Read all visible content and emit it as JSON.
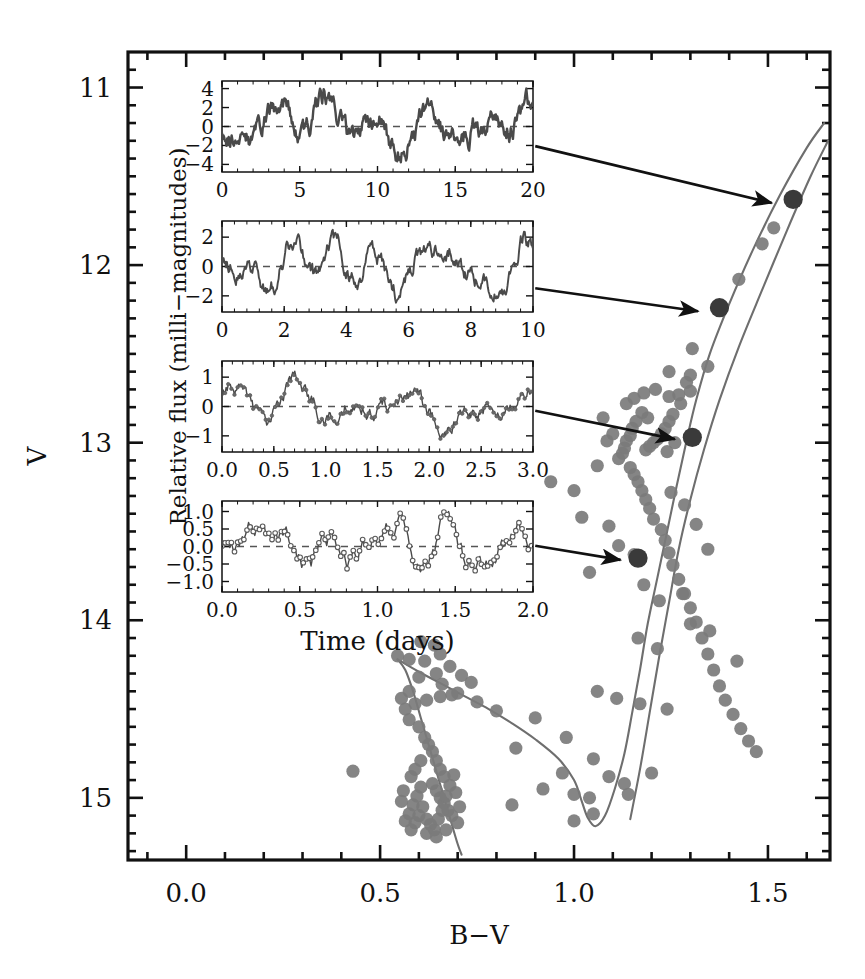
{
  "figure": {
    "type": "scatter-with-insets",
    "background": "#ffffff",
    "ink": "#111111",
    "point_color": "#7b7b7b",
    "highlight_color": "#3a3a3a",
    "isochrone_color": "#6e6e6e"
  },
  "main_axes": {
    "xlabel": "B−V",
    "ylabel": "V",
    "xlim": [
      -0.15,
      1.66
    ],
    "ylim_inverted": [
      15.35,
      10.8
    ],
    "xticks_major": [
      0.0,
      0.5,
      1.0,
      1.5
    ],
    "xtick_labels": [
      "0.0",
      "0.5",
      "1.0",
      "1.5"
    ],
    "xtick_minor_step": 0.1,
    "yticks_major": [
      11,
      12,
      13,
      14,
      15
    ],
    "ytick_labels": [
      "11",
      "12",
      "13",
      "14",
      "15"
    ],
    "ytick_minor_step": 0.1,
    "grid": false,
    "frame": true
  },
  "chart_data": {
    "type": "scatter",
    "title": "",
    "xlabel": "B−V",
    "ylabel": "V",
    "xlim": [
      -0.15,
      1.66
    ],
    "ylim": [
      15.35,
      10.8
    ],
    "ylim_note": "magnitude axis inverted (brighter at top)",
    "grid": false,
    "legend": null,
    "series": [
      {
        "name": "cluster members",
        "marker": "filled circle",
        "color": "#7b7b7b",
        "points": [
          [
            1.565,
            11.63
          ],
          [
            1.515,
            11.79
          ],
          [
            1.485,
            11.88
          ],
          [
            1.425,
            12.08
          ],
          [
            1.375,
            12.24
          ],
          [
            1.305,
            12.47
          ],
          [
            1.245,
            12.6
          ],
          [
            1.345,
            12.57
          ],
          [
            1.3,
            12.71
          ],
          [
            1.275,
            12.78
          ],
          [
            1.255,
            12.84
          ],
          [
            1.245,
            12.88
          ],
          [
            1.235,
            12.92
          ],
          [
            1.225,
            12.95
          ],
          [
            1.215,
            12.98
          ],
          [
            1.205,
            13.0
          ],
          [
            1.195,
            13.02
          ],
          [
            1.185,
            13.04
          ],
          [
            1.24,
            13.05
          ],
          [
            1.26,
            13.0
          ],
          [
            1.19,
            12.86
          ],
          [
            1.175,
            12.83
          ],
          [
            1.16,
            12.88
          ],
          [
            1.15,
            12.92
          ],
          [
            1.145,
            12.96
          ],
          [
            1.135,
            12.99
          ],
          [
            1.13,
            13.03
          ],
          [
            1.125,
            13.06
          ],
          [
            1.115,
            13.09
          ],
          [
            1.1,
            12.95
          ],
          [
            1.085,
            12.99
          ],
          [
            1.075,
            12.86
          ],
          [
            1.135,
            12.78
          ],
          [
            1.155,
            12.75
          ],
          [
            1.18,
            12.72
          ],
          [
            1.21,
            12.7
          ],
          [
            1.245,
            12.74
          ],
          [
            1.27,
            12.73
          ],
          [
            1.29,
            12.66
          ],
          [
            1.3,
            12.62
          ],
          [
            1.145,
            13.14
          ],
          [
            1.155,
            13.18
          ],
          [
            1.165,
            13.22
          ],
          [
            1.175,
            13.27
          ],
          [
            1.185,
            13.32
          ],
          [
            1.195,
            13.37
          ],
          [
            1.205,
            13.43
          ],
          [
            1.225,
            13.49
          ],
          [
            1.235,
            13.55
          ],
          [
            1.245,
            13.62
          ],
          [
            1.255,
            13.69
          ],
          [
            1.27,
            13.77
          ],
          [
            1.285,
            13.85
          ],
          [
            1.3,
            13.93
          ],
          [
            1.315,
            14.01
          ],
          [
            1.33,
            14.1
          ],
          [
            1.345,
            14.19
          ],
          [
            1.36,
            14.28
          ],
          [
            1.375,
            14.37
          ],
          [
            1.39,
            14.45
          ],
          [
            1.41,
            14.53
          ],
          [
            1.43,
            14.61
          ],
          [
            1.45,
            14.68
          ],
          [
            1.47,
            14.74
          ],
          [
            1.25,
            13.28
          ],
          [
            1.285,
            13.35
          ],
          [
            1.315,
            13.46
          ],
          [
            1.345,
            13.6
          ],
          [
            1.06,
            13.13
          ],
          [
            1.0,
            13.27
          ],
          [
            0.94,
            13.22
          ],
          [
            1.02,
            13.42
          ],
          [
            1.09,
            13.47
          ],
          [
            1.115,
            13.58
          ],
          [
            1.155,
            13.63
          ],
          [
            1.04,
            13.73
          ],
          [
            1.18,
            13.8
          ],
          [
            1.22,
            13.89
          ],
          [
            1.28,
            13.85
          ],
          [
            1.3,
            14.02
          ],
          [
            1.35,
            14.06
          ],
          [
            1.42,
            14.23
          ],
          [
            1.165,
            14.1
          ],
          [
            1.215,
            14.16
          ],
          [
            1.06,
            14.4
          ],
          [
            1.11,
            14.44
          ],
          [
            1.17,
            14.47
          ],
          [
            1.24,
            14.5
          ],
          [
            0.98,
            14.66
          ],
          [
            1.05,
            14.78
          ],
          [
            1.09,
            14.88
          ],
          [
            1.13,
            14.92
          ],
          [
            1.0,
            14.98
          ],
          [
            1.04,
            15.0
          ],
          [
            0.85,
            14.72
          ],
          [
            0.9,
            14.55
          ],
          [
            0.8,
            14.51
          ],
          [
            0.75,
            14.46
          ],
          [
            0.7,
            14.41
          ],
          [
            0.66,
            14.36
          ],
          [
            0.645,
            14.3
          ],
          [
            0.68,
            14.26
          ],
          [
            0.71,
            14.31
          ],
          [
            0.735,
            14.35
          ],
          [
            0.615,
            14.23
          ],
          [
            0.575,
            14.22
          ],
          [
            0.545,
            14.2
          ],
          [
            0.605,
            14.12
          ],
          [
            0.64,
            14.14
          ],
          [
            0.655,
            14.19
          ],
          [
            0.6,
            14.32
          ],
          [
            0.575,
            14.4
          ],
          [
            0.555,
            14.44
          ],
          [
            0.565,
            14.5
          ],
          [
            0.59,
            14.47
          ],
          [
            0.62,
            14.45
          ],
          [
            0.655,
            14.43
          ],
          [
            0.685,
            14.42
          ],
          [
            0.575,
            14.56
          ],
          [
            0.6,
            14.6
          ],
          [
            0.615,
            14.66
          ],
          [
            0.625,
            14.7
          ],
          [
            0.635,
            14.74
          ],
          [
            0.645,
            14.79
          ],
          [
            0.655,
            14.84
          ],
          [
            0.665,
            14.88
          ],
          [
            0.605,
            14.79
          ],
          [
            0.59,
            14.84
          ],
          [
            0.58,
            14.88
          ],
          [
            0.635,
            14.92
          ],
          [
            0.645,
            14.96
          ],
          [
            0.655,
            15.0
          ],
          [
            0.665,
            15.03
          ],
          [
            0.675,
            15.07
          ],
          [
            0.685,
            15.1
          ],
          [
            0.605,
            14.94
          ],
          [
            0.595,
            14.99
          ],
          [
            0.585,
            15.04
          ],
          [
            0.575,
            15.09
          ],
          [
            0.62,
            15.12
          ],
          [
            0.63,
            15.15
          ],
          [
            0.64,
            15.18
          ],
          [
            0.65,
            15.12
          ],
          [
            0.66,
            15.07
          ],
          [
            0.67,
            14.99
          ],
          [
            0.68,
            14.93
          ],
          [
            0.69,
            14.87
          ],
          [
            0.695,
            14.97
          ],
          [
            0.61,
            15.05
          ],
          [
            0.6,
            15.1
          ],
          [
            0.59,
            15.14
          ],
          [
            0.62,
            15.2
          ],
          [
            0.645,
            15.22
          ],
          [
            0.67,
            15.18
          ],
          [
            0.7,
            15.14
          ],
          [
            0.705,
            15.05
          ],
          [
            0.56,
            14.96
          ],
          [
            0.555,
            15.02
          ],
          [
            0.565,
            15.13
          ],
          [
            0.58,
            15.18
          ],
          [
            0.43,
            14.85
          ],
          [
            0.84,
            15.04
          ],
          [
            0.92,
            14.95
          ],
          [
            0.97,
            14.86
          ],
          [
            1.0,
            15.13
          ],
          [
            1.05,
            15.09
          ],
          [
            1.14,
            14.98
          ],
          [
            1.2,
            14.86
          ]
        ]
      },
      {
        "name": "highlighted targets (with light curves)",
        "marker": "large filled circle",
        "color": "#3a3a3a",
        "points": [
          [
            1.565,
            11.63
          ],
          [
            1.375,
            12.24
          ],
          [
            1.305,
            12.97
          ],
          [
            1.165,
            13.65
          ]
        ]
      }
    ],
    "isochrones": [
      {
        "name": "isochrone-left",
        "color": "#6e6e6e",
        "path": [
          [
            0.545,
            14.22
          ],
          [
            0.565,
            14.28
          ],
          [
            0.585,
            14.4
          ],
          [
            0.605,
            14.55
          ],
          [
            0.625,
            14.7
          ],
          [
            0.645,
            14.85
          ],
          [
            0.665,
            15.0
          ],
          [
            0.685,
            15.15
          ],
          [
            0.7,
            15.26
          ],
          [
            0.71,
            15.32
          ]
        ]
      },
      {
        "name": "isochrone-turnoff-to-giant",
        "color": "#6e6e6e",
        "path": [
          [
            0.545,
            14.22
          ],
          [
            0.6,
            14.29
          ],
          [
            0.66,
            14.36
          ],
          [
            0.72,
            14.43
          ],
          [
            0.78,
            14.5
          ],
          [
            0.84,
            14.58
          ],
          [
            0.9,
            14.67
          ],
          [
            0.96,
            14.78
          ],
          [
            1.0,
            14.9
          ],
          [
            1.02,
            15.02
          ],
          [
            1.035,
            15.11
          ],
          [
            1.055,
            15.16
          ],
          [
            1.08,
            15.1
          ],
          [
            1.105,
            14.95
          ],
          [
            1.13,
            14.75
          ],
          [
            1.15,
            14.52
          ],
          [
            1.17,
            14.28
          ],
          [
            1.19,
            14.02
          ],
          [
            1.215,
            13.76
          ],
          [
            1.24,
            13.5
          ],
          [
            1.265,
            13.24
          ],
          [
            1.29,
            12.99
          ],
          [
            1.315,
            12.76
          ],
          [
            1.35,
            12.5
          ],
          [
            1.4,
            12.22
          ],
          [
            1.46,
            11.92
          ],
          [
            1.53,
            11.61
          ],
          [
            1.6,
            11.34
          ],
          [
            1.645,
            11.2
          ]
        ]
      },
      {
        "name": "isochrone-giant-branch-right",
        "color": "#6e6e6e",
        "path": [
          [
            1.145,
            15.12
          ],
          [
            1.17,
            14.84
          ],
          [
            1.195,
            14.52
          ],
          [
            1.22,
            14.2
          ],
          [
            1.245,
            13.9
          ],
          [
            1.27,
            13.6
          ],
          [
            1.3,
            13.32
          ],
          [
            1.335,
            13.04
          ],
          [
            1.375,
            12.76
          ],
          [
            1.425,
            12.46
          ],
          [
            1.485,
            12.14
          ],
          [
            1.55,
            11.8
          ],
          [
            1.61,
            11.5
          ],
          [
            1.655,
            11.3
          ]
        ]
      }
    ],
    "annotations": [
      {
        "name": "arrow-1",
        "from": [
          0.9,
          11.33
        ],
        "to": [
          1.51,
          11.65
        ]
      },
      {
        "name": "arrow-2",
        "from": [
          0.9,
          12.13
        ],
        "to": [
          1.32,
          12.26
        ]
      },
      {
        "name": "arrow-3",
        "from": [
          0.9,
          12.82
        ],
        "to": [
          1.26,
          12.98
        ]
      },
      {
        "name": "arrow-4",
        "from": [
          0.9,
          13.58
        ],
        "to": [
          1.12,
          13.66
        ]
      }
    ]
  },
  "insets": {
    "shared_xlabel": "Time (days)",
    "shared_ylabel": "Relative flux (milli−magnitudes)",
    "panels": [
      {
        "name": "light-curve-panel-1",
        "xlim": [
          0,
          20
        ],
        "xticks": [
          0,
          5,
          10,
          15,
          20
        ],
        "xtick_labels": [
          "0",
          "5",
          "10",
          "15",
          "20"
        ],
        "ylim": [
          -4.8,
          4.8
        ],
        "yticks": [
          -4,
          -2,
          0,
          2,
          4
        ],
        "ytick_labels": [
          "−4",
          "−2",
          "0",
          "2",
          "4"
        ],
        "zero_line": 0,
        "amplitude_mmag": 4,
        "marker": "dense line",
        "seed": 11,
        "npoints": 420,
        "roughness": 0.55,
        "scale": 1.85
      },
      {
        "name": "light-curve-panel-2",
        "xlim": [
          0,
          10
        ],
        "xticks": [
          0,
          2,
          4,
          6,
          8,
          10
        ],
        "xtick_labels": [
          "0",
          "2",
          "4",
          "6",
          "8",
          "10"
        ],
        "ylim": [
          -3.1,
          3.1
        ],
        "yticks": [
          -2,
          0,
          2
        ],
        "ytick_labels": [
          "−2",
          "0",
          "2"
        ],
        "zero_line": 0,
        "amplitude_mmag": 2.5,
        "marker": "dense line",
        "seed": 29,
        "npoints": 380,
        "roughness": 0.5,
        "scale": 1.25
      },
      {
        "name": "light-curve-panel-3",
        "xlim": [
          0,
          3
        ],
        "xticks": [
          0,
          0.5,
          1.0,
          1.5,
          2.0,
          2.5,
          3.0
        ],
        "xtick_labels": [
          "0.0",
          "0.5",
          "1.0",
          "1.5",
          "2.0",
          "2.5",
          "3.0"
        ],
        "ylim": [
          -1.55,
          1.55
        ],
        "yticks": [
          -1,
          0,
          1
        ],
        "ytick_labels": [
          "−1",
          "0",
          "1"
        ],
        "zero_line": 0,
        "amplitude_mmag": 1.2,
        "marker": "points + line",
        "seed": 47,
        "npoints": 300,
        "roughness": 0.45,
        "scale": 0.62
      },
      {
        "name": "light-curve-panel-4",
        "xlim": [
          0,
          2
        ],
        "xticks": [
          0,
          0.5,
          1.0,
          1.5,
          2.0
        ],
        "xtick_labels": [
          "0.0",
          "0.5",
          "1.0",
          "1.5",
          "2.0"
        ],
        "ylim": [
          -1.3,
          1.3
        ],
        "yticks": [
          -1.0,
          -0.5,
          0.0,
          0.5,
          1.0
        ],
        "ytick_labels": [
          "−1.0",
          "−0.5",
          "0.0",
          "0.5",
          "1.0"
        ],
        "zero_line": 0,
        "amplitude_mmag": 1.0,
        "marker": "open circles + line",
        "seed": 73,
        "npoints": 200,
        "roughness": 0.62,
        "scale": 0.5
      }
    ]
  }
}
